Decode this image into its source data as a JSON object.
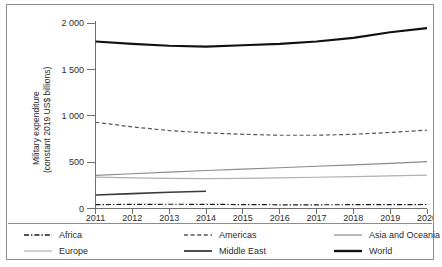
{
  "chart_data": {
    "type": "line",
    "title": "",
    "xlabel": "",
    "ylabel": "Military expenditure\n(constant 2019 US$ billions)",
    "ylabel_line1": "Military expenditure",
    "ylabel_line2": "(constant 2019 US$ billions)",
    "x": [
      2011,
      2012,
      2013,
      2014,
      2015,
      2016,
      2017,
      2018,
      2019,
      2020
    ],
    "xtick_labels": [
      "2011",
      "2012",
      "2013",
      "2014",
      "2015",
      "2016",
      "2017",
      "2018",
      "2019",
      "2020"
    ],
    "ytick_labels": [
      "0",
      "500",
      "1 000",
      "1 500",
      "2 000"
    ],
    "ytick_values": [
      0,
      500,
      1000,
      1500,
      2000
    ],
    "ylim": [
      0,
      2000
    ],
    "xlim": [
      2011,
      2020
    ],
    "grid": false,
    "legend_position": "bottom",
    "series": [
      {
        "name": "Africa",
        "style": "dash-dot",
        "color": "#1a1a1a",
        "width": 1.2,
        "x": [
          2011,
          2012,
          2013,
          2014,
          2015,
          2016,
          2017,
          2018,
          2019,
          2020
        ],
        "values": [
          42,
          44,
          46,
          45,
          42,
          40,
          40,
          41,
          42,
          43
        ]
      },
      {
        "name": "Americas",
        "style": "dashed",
        "color": "#555555",
        "width": 1.2,
        "x": [
          2011,
          2012,
          2013,
          2014,
          2015,
          2016,
          2017,
          2018,
          2019,
          2020
        ],
        "values": [
          930,
          880,
          840,
          815,
          800,
          790,
          790,
          800,
          820,
          845
        ]
      },
      {
        "name": "Asia and Oceania",
        "style": "solid",
        "color": "#8a8a8a",
        "width": 1.1,
        "x": [
          2011,
          2012,
          2013,
          2014,
          2015,
          2016,
          2017,
          2018,
          2019,
          2020
        ],
        "values": [
          357,
          375,
          392,
          410,
          425,
          440,
          455,
          470,
          487,
          505
        ]
      },
      {
        "name": "Europe",
        "style": "solid",
        "color": "#b0b0b0",
        "width": 1.1,
        "x": [
          2011,
          2012,
          2013,
          2014,
          2015,
          2016,
          2017,
          2018,
          2019,
          2020
        ],
        "values": [
          338,
          330,
          325,
          322,
          325,
          330,
          337,
          344,
          352,
          360
        ]
      },
      {
        "name": "Middle East",
        "style": "solid",
        "color": "#3a3a3a",
        "width": 1.6,
        "x": [
          2011,
          2012,
          2013,
          2014
        ],
        "values": [
          145,
          160,
          175,
          186
        ]
      },
      {
        "name": "World",
        "style": "solid",
        "color": "#111111",
        "width": 2.1,
        "x": [
          2011,
          2012,
          2013,
          2014,
          2015,
          2016,
          2017,
          2018,
          2019,
          2020
        ],
        "values": [
          1800,
          1775,
          1755,
          1745,
          1760,
          1775,
          1800,
          1840,
          1900,
          1945
        ]
      }
    ]
  },
  "legend": {
    "items": [
      {
        "label": "Africa",
        "style": "dash-dot",
        "color": "#1a1a1a",
        "width": 1.4
      },
      {
        "label": "Americas",
        "style": "dashed",
        "color": "#555555",
        "width": 1.4
      },
      {
        "label": "Asia and Oceania",
        "style": "solid",
        "color": "#8a8a8a",
        "width": 1.2
      },
      {
        "label": "Europe",
        "style": "solid",
        "color": "#b0b0b0",
        "width": 1.2
      },
      {
        "label": "Middle East",
        "style": "solid",
        "color": "#3a3a3a",
        "width": 1.8
      },
      {
        "label": "World",
        "style": "solid",
        "color": "#111111",
        "width": 2.4
      }
    ],
    "order": [
      0,
      1,
      2,
      3,
      4,
      5
    ],
    "column_order": [
      "Africa",
      "Americas",
      "Asia and Oceania",
      "Europe",
      "Middle East",
      "World"
    ]
  }
}
